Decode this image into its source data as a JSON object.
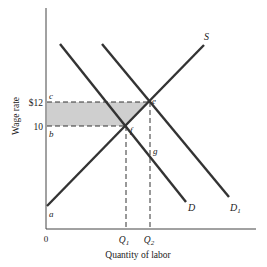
{
  "diagram": {
    "type": "labor-market supply-demand",
    "axes": {
      "y_label": "Wage rate",
      "x_label": "Quantity of labor",
      "origin_label": "0"
    },
    "y_ticks": [
      {
        "label": "$12",
        "point_label": "c",
        "y": 102
      },
      {
        "label": "10",
        "point_label": "b",
        "y": 126
      }
    ],
    "x_ticks": [
      {
        "label": "Q",
        "sub": "1",
        "x": 126
      },
      {
        "label": "Q",
        "sub": "2",
        "x": 150
      }
    ],
    "curves": [
      {
        "name": "S",
        "label": "S",
        "sub": ""
      },
      {
        "name": "D",
        "label": "D",
        "sub": ""
      },
      {
        "name": "D1",
        "label": "D",
        "sub": "1"
      }
    ],
    "points": {
      "a": "a",
      "b": "b",
      "c": "c",
      "e": "e",
      "f": "f",
      "g": "g"
    },
    "shaded_region": "area between $12 and $10 bounded by wage axis, supply curve (c-e-f-b)",
    "colors": {
      "line": "#333333",
      "shade": "#cccccc",
      "dash": "#333333"
    }
  }
}
